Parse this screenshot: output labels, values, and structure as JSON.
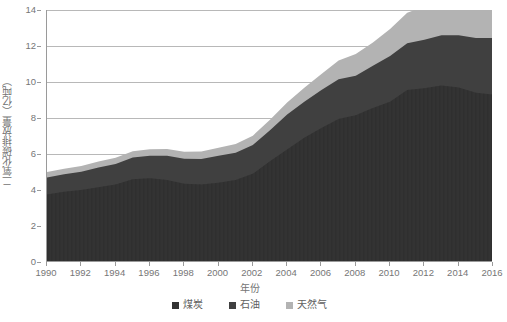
{
  "chart_data": {
    "type": "area",
    "stacked": true,
    "title": "",
    "xlabel": "年份",
    "ylabel": "二氧化碳排放量（亿吨）",
    "ylim": [
      0,
      14
    ],
    "yticks": [
      0,
      2,
      4,
      6,
      8,
      10,
      12,
      14
    ],
    "xlim": [
      1990,
      2016
    ],
    "xticks": [
      1990,
      1992,
      1994,
      1996,
      1998,
      2000,
      2002,
      2004,
      2006,
      2008,
      2010,
      2012,
      2014,
      2016
    ],
    "grid": true,
    "legend_position": "bottom",
    "x": [
      1990,
      1991,
      1992,
      1993,
      1994,
      1995,
      1996,
      1997,
      1998,
      1999,
      2000,
      2001,
      2002,
      2003,
      2004,
      2005,
      2006,
      2007,
      2008,
      2009,
      2010,
      2011,
      2012,
      2013,
      2014,
      2015,
      2016
    ],
    "series": [
      {
        "name": "煤炭",
        "color": "#333333",
        "values": [
          3.75,
          3.9,
          4.0,
          4.15,
          4.3,
          4.6,
          4.65,
          4.55,
          4.35,
          4.3,
          4.4,
          4.55,
          4.9,
          5.6,
          6.25,
          6.9,
          7.45,
          7.95,
          8.15,
          8.55,
          8.9,
          9.55,
          9.65,
          9.8,
          9.7,
          9.4,
          9.3
        ]
      },
      {
        "name": "石油",
        "color": "#404040",
        "values": [
          0.95,
          0.98,
          1.02,
          1.1,
          1.15,
          1.2,
          1.25,
          1.35,
          1.38,
          1.42,
          1.5,
          1.52,
          1.6,
          1.72,
          1.95,
          2.0,
          2.1,
          2.2,
          2.2,
          2.35,
          2.55,
          2.6,
          2.7,
          2.8,
          2.9,
          3.05,
          3.15
        ]
      },
      {
        "name": "天然气",
        "color": "#b3b3b3",
        "values": [
          0.3,
          0.3,
          0.32,
          0.33,
          0.34,
          0.35,
          0.37,
          0.38,
          0.4,
          0.42,
          0.45,
          0.48,
          0.52,
          0.58,
          0.66,
          0.78,
          0.9,
          1.05,
          1.2,
          1.3,
          1.5,
          1.7,
          1.85,
          2.05,
          2.15,
          2.2,
          2.3
        ]
      }
    ]
  }
}
